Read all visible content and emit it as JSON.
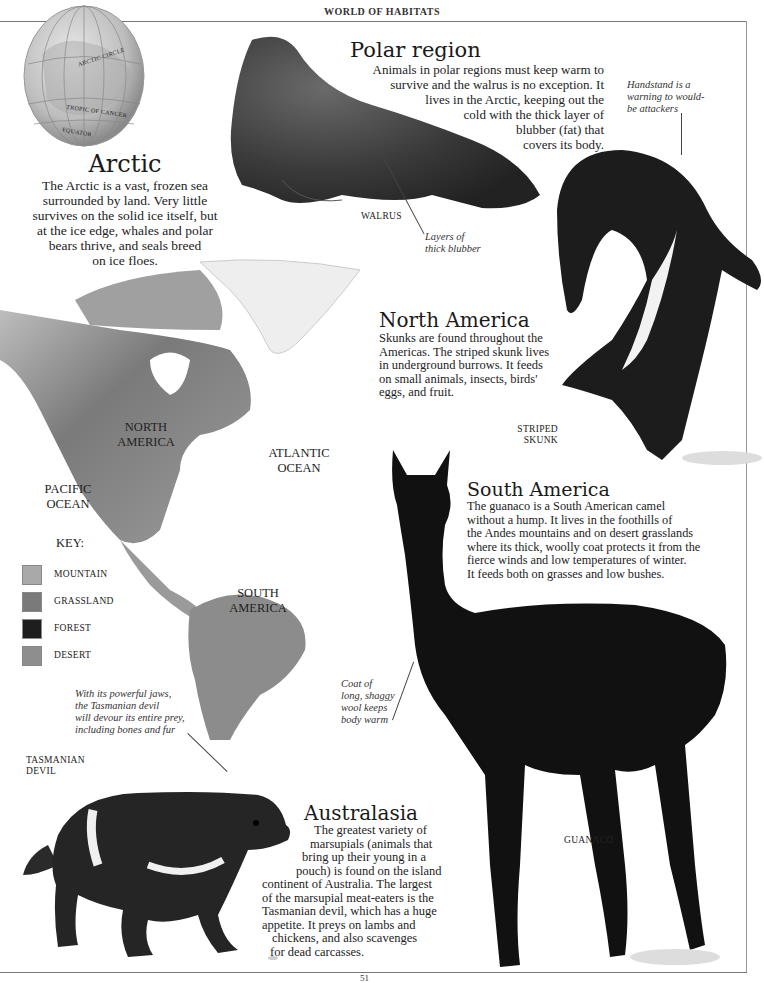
{
  "page": {
    "running_head": "WORLD OF HABITATS",
    "folio": "51"
  },
  "globe": {
    "labels": [
      "ARCTIC CIRCLE",
      "TROPIC OF CANCER",
      "EQUATOR"
    ]
  },
  "arctic": {
    "heading": "Arctic",
    "body": "The Arctic is a vast, frozen sea surrounded by land. Very little survives on the solid ice itself, but at the ice edge, whales and polar bears thrive, and seals breed on ice floes.",
    "lines": [
      "The Arctic is a vast, frozen sea",
      "surrounded by land. Very little",
      "survives on the solid ice itself, but",
      "at the ice edge, whales and polar",
      "bears thrive, and seals breed",
      "on ice floes."
    ]
  },
  "polar": {
    "heading": "Polar region",
    "lines": [
      "Animals in polar regions must keep warm to",
      "survive and the walrus is no exception. It",
      "lives in the Arctic, keeping out the",
      "cold with the thick layer of",
      "blubber (fat) that",
      "covers its body."
    ],
    "animal_label": "WALRUS",
    "caption_blubber": [
      "Layers of",
      "thick blubber"
    ]
  },
  "skunk": {
    "caption": [
      "Handstand is a",
      "warning to would-",
      "be attackers"
    ],
    "animal_label": [
      "STRIPED",
      "SKUNK"
    ]
  },
  "north_america": {
    "heading": "North America",
    "lines": [
      "Skunks are found throughout the",
      "Americas. The striped skunk lives",
      "in underground burrows. It feeds",
      "on small animals, insects, birds'",
      "eggs, and fruit."
    ]
  },
  "map": {
    "labels": {
      "north_america": [
        "NORTH",
        "AMERICA"
      ],
      "south_america": [
        "SOUTH",
        "AMERICA"
      ],
      "atlantic": [
        "ATLANTIC",
        "OCEAN"
      ],
      "pacific": [
        "PACIFIC",
        "OCEAN"
      ]
    },
    "key": {
      "title": "KEY:",
      "items": [
        {
          "label": "MOUNTAIN",
          "color": "#a9a9a9"
        },
        {
          "label": "GRASSLAND",
          "color": "#7a7a7a"
        },
        {
          "label": "FOREST",
          "color": "#1e1e1e"
        },
        {
          "label": "DESERT",
          "color": "#8e8e8e"
        }
      ]
    }
  },
  "south_america": {
    "heading": "South America",
    "lines": [
      "The guanaco is a South American camel",
      "without a hump. It lives in the foothills of",
      "the Andes mountains and on desert grasslands",
      "where its thick, woolly coat protects it from the",
      "fierce winds and low temperatures of winter.",
      "It feeds both on grasses and low bushes."
    ],
    "caption_coat": [
      "Coat of",
      "long, shaggy",
      "wool keeps",
      "body warm"
    ],
    "animal_label": "GUANACO"
  },
  "tasmanian": {
    "caption": [
      "With its powerful jaws,",
      "the Tasmanian devil",
      "will devour its entire prey,",
      "including bones and fur"
    ],
    "animal_label": [
      "TASMANIAN",
      "DEVIL"
    ]
  },
  "australasia": {
    "heading": "Australasia",
    "lines": [
      "The greatest variety of",
      "marsupials (animals that",
      "bring up their young in a",
      "pouch) is found on the island",
      "continent of Australia. The largest",
      "of the marsupial meat-eaters is the",
      "Tasmanian devil, which has a huge",
      "appetite. It preys on lambs and",
      "chickens, and also scavenges",
      "for dead carcasses."
    ]
  }
}
